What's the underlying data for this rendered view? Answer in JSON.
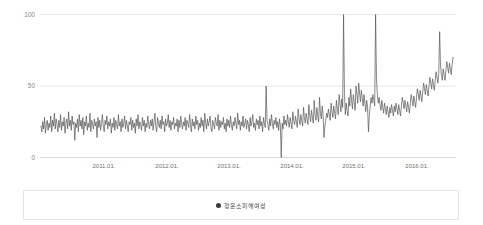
{
  "chart_data": {
    "type": "line",
    "title": "",
    "xlabel": "",
    "ylabel": "",
    "ylim": [
      0,
      100
    ],
    "grid": true,
    "legend_position": "bottom",
    "y_ticks": [
      "0",
      "50",
      "100"
    ],
    "y_tick_values": [
      0,
      50,
      100
    ],
    "x_ticks": [
      "2011.01.",
      "2012.01.",
      "2013.01.",
      "2014.01.",
      "2015.01.",
      "2016.01."
    ],
    "x_tick_positions": [
      0.155,
      0.305,
      0.455,
      0.605,
      0.755,
      0.905
    ],
    "series": [
      {
        "name": "정운소피해여성",
        "color": "#555555",
        "values": [
          22,
          18,
          25,
          20,
          28,
          17,
          23,
          26,
          19,
          24,
          21,
          29,
          18,
          26,
          22,
          31,
          20,
          27,
          23,
          18,
          26,
          21,
          30,
          19,
          25,
          22,
          28,
          17,
          24,
          27,
          20,
          32,
          22,
          26,
          19,
          29,
          23,
          25,
          12,
          24,
          21,
          27,
          18,
          30,
          22,
          26,
          20,
          28,
          16,
          25,
          22,
          29,
          19,
          24,
          21,
          31,
          18,
          26,
          23,
          20,
          27,
          22,
          25,
          14,
          28,
          21,
          26,
          19,
          24,
          30,
          22,
          18,
          26,
          23,
          29,
          20,
          25,
          22,
          27,
          17,
          24,
          21,
          28,
          19,
          26,
          23,
          20,
          30,
          22,
          25,
          18,
          27,
          21,
          24,
          29,
          20,
          26,
          22,
          18,
          25,
          23,
          28,
          19,
          26,
          21,
          24,
          17,
          27,
          22,
          30,
          20,
          25,
          23,
          19,
          28,
          22,
          26,
          18,
          24,
          21,
          29,
          23,
          20,
          26,
          22,
          27,
          19,
          25,
          31,
          22,
          18,
          28,
          24,
          21,
          26,
          20,
          29,
          23,
          25,
          18,
          27,
          22,
          24,
          30,
          21,
          26,
          19,
          25,
          23,
          28,
          20,
          24,
          22,
          27,
          18,
          26,
          21,
          29,
          23,
          20,
          25,
          22,
          28,
          19,
          26,
          24,
          21,
          30,
          23,
          18,
          27,
          22,
          25,
          20,
          29,
          23,
          26,
          19,
          24,
          21,
          28,
          22,
          26,
          18,
          31,
          24,
          20,
          27,
          22,
          25,
          29,
          21,
          18,
          26,
          23,
          20,
          28,
          24,
          22,
          30,
          19,
          26,
          21,
          25,
          23,
          28,
          20,
          24,
          18,
          27,
          22,
          26,
          21,
          29,
          23,
          19,
          25,
          22,
          28,
          24,
          20,
          31,
          23,
          26,
          19,
          25,
          22,
          29,
          21,
          24,
          27,
          20,
          26,
          23,
          18,
          28,
          22,
          25,
          30,
          21,
          24,
          19,
          27,
          23,
          26,
          20,
          29,
          22,
          25,
          18,
          28,
          24,
          21,
          50,
          26,
          23,
          19,
          27,
          22,
          30,
          24,
          20,
          26,
          23,
          28,
          21,
          25,
          19,
          27,
          22,
          0,
          24,
          20,
          29,
          23,
          26,
          22,
          30,
          25,
          21,
          28,
          24,
          20,
          32,
          26,
          23,
          29,
          25,
          21,
          34,
          27,
          23,
          30,
          26,
          22,
          35,
          28,
          24,
          31,
          27,
          23,
          37,
          29,
          25,
          33,
          28,
          24,
          40,
          30,
          26,
          35,
          29,
          25,
          42,
          31,
          27,
          36,
          30,
          14,
          22,
          26,
          31,
          28,
          34,
          30,
          26,
          38,
          32,
          28,
          36,
          31,
          27,
          40,
          34,
          30,
          44,
          38,
          32,
          41,
          35,
          100,
          45,
          30,
          38,
          33,
          29,
          42,
          36,
          48,
          40,
          34,
          44,
          39,
          33,
          50,
          44,
          38,
          52,
          45,
          39,
          47,
          42,
          36,
          44,
          38,
          32,
          40,
          35,
          18,
          30,
          36,
          42,
          38,
          44,
          40,
          36,
          100,
          55,
          44,
          38,
          42,
          37,
          33,
          40,
          35,
          31,
          38,
          34,
          30,
          36,
          32,
          28,
          35,
          31,
          37,
          33,
          29,
          36,
          32,
          38,
          34,
          30,
          37,
          33,
          29,
          36,
          42,
          38,
          34,
          40,
          36,
          32,
          39,
          35,
          31,
          38,
          44,
          40,
          36,
          43,
          39,
          35,
          42,
          48,
          44,
          40,
          47,
          43,
          39,
          46,
          52,
          48,
          44,
          51,
          47,
          43,
          50,
          56,
          52,
          48,
          55,
          51,
          47,
          54,
          60,
          56,
          52,
          59,
          88,
          64,
          58,
          54,
          62,
          58,
          54,
          61,
          67,
          63,
          59,
          66,
          62,
          58,
          65,
          70
        ]
      }
    ]
  },
  "legend": {
    "label": "정운소피해여성"
  },
  "colors": {
    "line": "#555555",
    "grid": "#e8e8e8",
    "axis_text": "#7a7a7a",
    "legend_dot": "#3b3b3b"
  }
}
